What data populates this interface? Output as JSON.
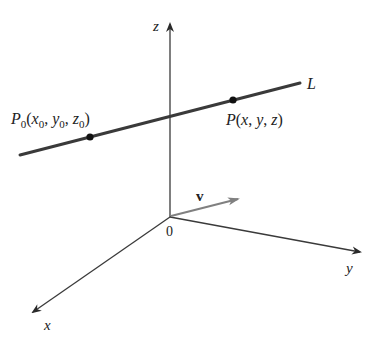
{
  "figure": {
    "axes": {
      "origin_label": "0",
      "x_label": "x",
      "y_label": "y",
      "z_label": "z"
    },
    "line": {
      "label": "L",
      "color": "#3a3a3a"
    },
    "points": {
      "p0": {
        "name": "P",
        "sub": "0",
        "coords_text": [
          "(",
          "x",
          "0",
          ", ",
          "y",
          "0",
          ", ",
          "z",
          "0",
          ")"
        ]
      },
      "p": {
        "label": "P(x, y, z)",
        "name": "P",
        "args": [
          "x",
          "y",
          "z"
        ]
      }
    },
    "vector": {
      "label": "v",
      "color": "#808080"
    },
    "colors": {
      "axis": "#3a3a3a",
      "vector": "#808080",
      "background": "#ffffff"
    }
  }
}
